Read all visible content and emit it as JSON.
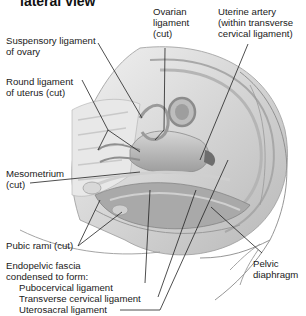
{
  "title": "lateral view",
  "labels": {
    "suspensory": [
      "Suspensory ligament",
      "of ovary"
    ],
    "round": [
      "Round ligament",
      "of uterus (cut)"
    ],
    "ovarian": [
      "Ovarian",
      "ligament",
      "(cut)"
    ],
    "uterine_artery": [
      "Uterine artery",
      "(within transverse",
      "cervical ligament)"
    ],
    "mesometrium": [
      "Mesometrium",
      "(cut)"
    ],
    "pubic_rami": "Pubic rami (cut)",
    "endopelvic": [
      "Endopelvic fascia",
      "condensed to form:"
    ],
    "pubocervical": "Pubocervical ligament",
    "transverse_cervical": "Transverse cervical ligament",
    "uterosacral": "Uterosacral ligament",
    "pelvic_diaphragm": [
      "Pelvic",
      "diaphragm"
    ]
  },
  "colors": {
    "background": "#ffffff",
    "leader_line": "#222222",
    "tissue_light": "#e4e4e4",
    "tissue_mid": "#c4c4c4",
    "tissue_dark": "#8f8f8f"
  }
}
